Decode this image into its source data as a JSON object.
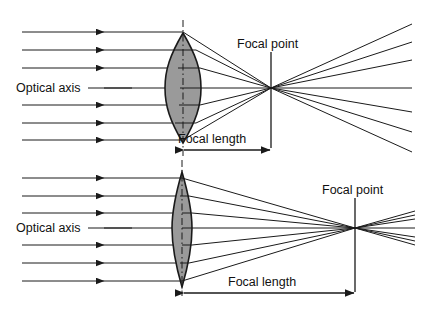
{
  "figure": {
    "background_color": "#ffffff",
    "line_color": "#1a1a1a",
    "lens_fill_color": "#9a9a9a",
    "lens_stroke_color": "#1a1a1a",
    "width": 425,
    "height": 311
  },
  "panels": [
    {
      "id": "top",
      "description": "Thick biconvex lens with short focal length",
      "optical_axis_label": "Optical axis",
      "focal_point_label": "Focal point",
      "focal_length_label": "Focal length",
      "ray_count": 6,
      "axis_y": 88,
      "lens_center_x": 183,
      "lens_top_y": 33,
      "lens_bottom_y": 143,
      "lens_half_thickness": 18,
      "focal_point_x": 271,
      "focal_length_px": 88,
      "ray_ys": [
        32,
        50,
        68,
        88,
        105,
        123,
        140
      ],
      "ray_start_x": 22,
      "arrow_tip_x": 112
    },
    {
      "id": "bottom",
      "description": "Thin biconvex lens with long focal length",
      "optical_axis_label": "Optical axis",
      "focal_point_label": "Focal point",
      "focal_length_label": "Focal length",
      "ray_count": 6,
      "axis_y": 228,
      "lens_center_x": 182,
      "lens_top_y": 172,
      "lens_bottom_y": 287,
      "lens_half_thickness": 10,
      "focal_point_x": 355,
      "focal_length_px": 173,
      "ray_ys": [
        178,
        196,
        213,
        228,
        245,
        263,
        281
      ],
      "ray_start_x": 22,
      "arrow_tip_x": 112
    }
  ],
  "labels": {
    "optical_axis": "Optical axis",
    "focal_point": "Focal point",
    "focal_length": "Focal length"
  }
}
